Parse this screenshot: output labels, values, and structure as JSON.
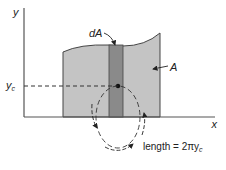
{
  "diagram": {
    "axes": {
      "x_label": "x",
      "y_label": "y"
    },
    "region": {
      "label": "A",
      "fill": "#c4c4c4",
      "edge": "#444444"
    },
    "strip": {
      "label": "dA",
      "fill": "#8a8a8a"
    },
    "centroid": {
      "label_main": "y",
      "label_sub": "c"
    },
    "rotation_path": {
      "formula_prefix": "length = 2πy",
      "formula_sub": "c"
    }
  }
}
